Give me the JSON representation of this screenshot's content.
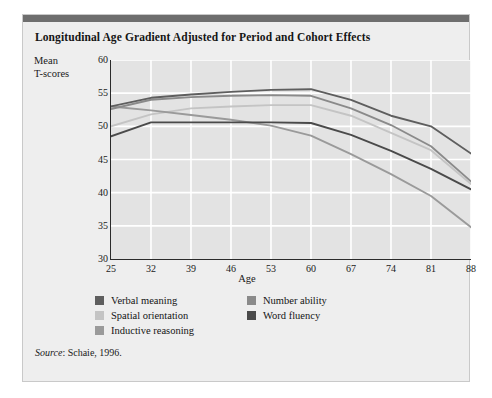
{
  "figure": {
    "title": "Longitudinal Age Gradient Adjusted for Period and Cohort Effects",
    "source_prefix": "Source",
    "source_text": ": Schaie, 1996."
  },
  "legend": {
    "column_left": [
      {
        "label": "Verbal meaning",
        "color": "#5e5e5e",
        "swatch_name": "legend-swatch-verbal-meaning"
      },
      {
        "label": "Spatial orientation",
        "color": "#c4c4c4",
        "swatch_name": "legend-swatch-spatial-orientation"
      },
      {
        "label": "Inductive reasoning",
        "color": "#9a9a9a",
        "swatch_name": "legend-swatch-inductive-reasoning"
      }
    ],
    "column_right": [
      {
        "label": "Number ability",
        "color": "#8a8a8a",
        "swatch_name": "legend-swatch-number-ability"
      },
      {
        "label": "Word fluency",
        "color": "#4a4a4a",
        "swatch_name": "legend-swatch-word-fluency"
      }
    ]
  },
  "chart_data": {
    "type": "line",
    "title": "Longitudinal Age Gradient Adjusted for Period and Cohort Effects",
    "xlabel": "Age",
    "ylabel": "Mean T-scores",
    "categories": [
      25,
      32,
      39,
      46,
      53,
      60,
      67,
      74,
      81,
      88
    ],
    "xtick_labels": [
      "25",
      "32",
      "39",
      "46",
      "53",
      "60",
      "67",
      "74",
      "81",
      "88"
    ],
    "ytick_labels": [
      "30",
      "35",
      "40",
      "45",
      "50",
      "55",
      "60"
    ],
    "ylim": [
      30,
      60
    ],
    "ytick_step": 5,
    "grid": true,
    "grid_color": "#ffffff",
    "plot_background": "#e3e3e3",
    "legend_position": "below",
    "series": [
      {
        "name": "Verbal meaning",
        "color": "#5e5e5e",
        "values": [
          53.0,
          54.3,
          54.8,
          55.2,
          55.5,
          55.6,
          54.0,
          51.6,
          50.0,
          45.9
        ]
      },
      {
        "name": "Spatial orientation",
        "color": "#c4c4c4",
        "values": [
          50.0,
          51.8,
          52.7,
          53.0,
          53.2,
          53.2,
          51.6,
          49.0,
          46.4,
          41.3
        ]
      },
      {
        "name": "Inductive reasoning",
        "color": "#9a9a9a",
        "values": [
          53.0,
          52.4,
          51.7,
          51.0,
          50.1,
          48.6,
          45.8,
          42.8,
          39.5,
          34.8
        ]
      },
      {
        "name": "Number ability",
        "color": "#8a8a8a",
        "values": [
          52.6,
          54.0,
          54.4,
          54.6,
          54.7,
          54.6,
          52.7,
          50.2,
          47.0,
          41.7
        ]
      },
      {
        "name": "Word fluency",
        "color": "#4a4a4a",
        "values": [
          48.5,
          50.6,
          50.6,
          50.6,
          50.6,
          50.5,
          48.7,
          46.3,
          43.6,
          40.5
        ]
      }
    ]
  }
}
